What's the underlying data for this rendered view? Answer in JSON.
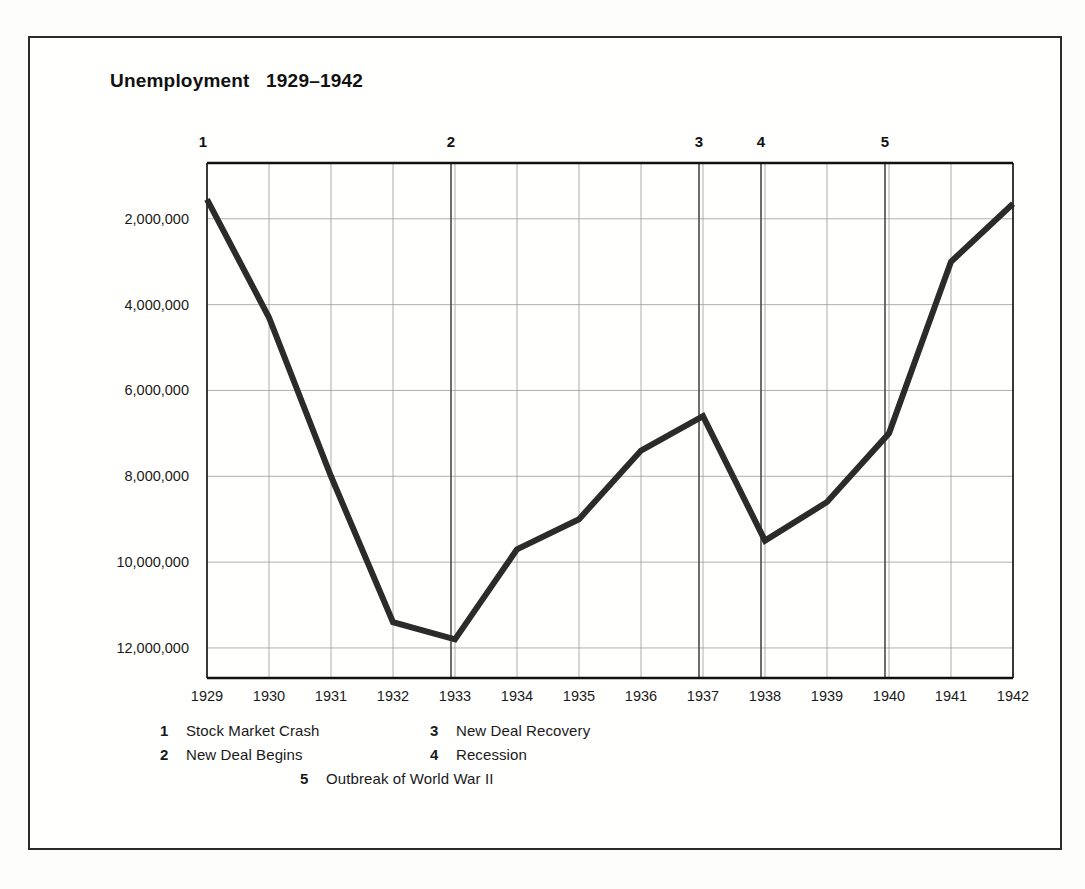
{
  "chart_data": {
    "type": "line",
    "title": "Unemployment   1929–1942",
    "title_main": "Unemployment",
    "title_range": "1929–1942",
    "xlabel": "",
    "ylabel": "",
    "categories": [
      1929,
      1930,
      1931,
      1932,
      1933,
      1934,
      1935,
      1936,
      1937,
      1938,
      1939,
      1940,
      1941,
      1942
    ],
    "x_ticks": [
      "1929",
      "1930",
      "1931",
      "1932",
      "1933",
      "1934",
      "1935",
      "1936",
      "1937",
      "1938",
      "1939",
      "1940",
      "1941",
      "1942"
    ],
    "y_ticks": [
      "2,000,000",
      "4,000,000",
      "6,000,000",
      "8,000,000",
      "10,000,000",
      "12,000,000"
    ],
    "y_tick_values": [
      2000000,
      4000000,
      6000000,
      8000000,
      10000000,
      12000000
    ],
    "ylim": [
      12700000,
      700000
    ],
    "y_inverted": true,
    "grid": true,
    "legend_position": "bottom",
    "series": [
      {
        "name": "Unemployment",
        "color": "#2b2b2b",
        "values": [
          1550000,
          4300000,
          8000000,
          11400000,
          11800000,
          9700000,
          9000000,
          7400000,
          6600000,
          9500000,
          8600000,
          7000000,
          3000000,
          1650000
        ]
      }
    ],
    "annotations": [
      {
        "num": "1",
        "year": 1929,
        "label": "Stock Market Crash"
      },
      {
        "num": "2",
        "year": 1933,
        "label": "New Deal Begins"
      },
      {
        "num": "3",
        "year": 1937,
        "label": "New Deal Recovery"
      },
      {
        "num": "4",
        "year": 1938,
        "label": "Recession"
      },
      {
        "num": "5",
        "year": 1940,
        "label": "Outbreak of World War II"
      }
    ]
  },
  "legend": {
    "row1": [
      {
        "num": "1",
        "text": "Stock Market Crash"
      },
      {
        "num": "3",
        "text": "New Deal Recovery"
      }
    ],
    "row2": [
      {
        "num": "2",
        "text": "New Deal Begins"
      },
      {
        "num": "4",
        "text": "Recession"
      }
    ],
    "row3": [
      {
        "num": "5",
        "text": "Outbreak of World War II"
      }
    ]
  },
  "colors": {
    "line": "#2b2b2b",
    "grid": "#9a9a9a",
    "axis": "#111111",
    "frame": "#2b2b2b",
    "text": "#1a1a1a",
    "background": "#fdfdfb"
  }
}
